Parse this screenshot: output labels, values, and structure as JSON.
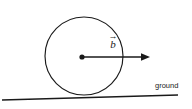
{
  "figure": {
    "background_color": "#ffffff",
    "stroke_color": "#1a1a1a",
    "width": 192,
    "height": 109
  },
  "labels": {
    "vector_symbol": "b",
    "vector_accent": "→",
    "vector_full": "b⃗",
    "ground": "ground"
  },
  "geometry": {
    "circle": {
      "center_x": 84,
      "center_y": 56,
      "radius": 39,
      "stroke_width": 1.15
    },
    "center_dot": {
      "x": 82,
      "y": 57,
      "radius": 2.6
    },
    "vector": {
      "start_x": 82,
      "start_y": 57,
      "end_x": 150,
      "end_y": 57,
      "head_length": 8,
      "head_width": 6,
      "direction": "right"
    },
    "ground": {
      "x1": 2,
      "y1": 100,
      "x2": 178,
      "y2": 95,
      "stroke_width": 1.4
    }
  }
}
